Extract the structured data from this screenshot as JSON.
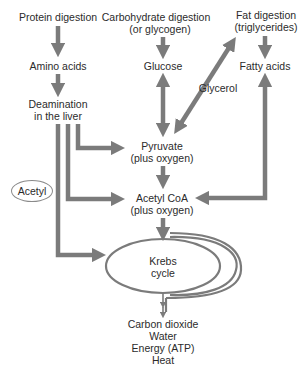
{
  "colors": {
    "arrow": "#7b7b7b",
    "text": "#2b2b2b",
    "background": "#ffffff"
  },
  "nodes": {
    "protein_digestion": "Protein digestion",
    "carb_digestion_1": "Carbohydrate digestion",
    "carb_digestion_2": "(or glycogen)",
    "fat_digestion_1": "Fat digestion",
    "fat_digestion_2": "(triglycerides)",
    "amino_acids": "Amino acids",
    "glucose": "Glucose",
    "fatty_acids": "Fatty acids",
    "glycerol": "Glycerol",
    "deamination_1": "Deamination",
    "deamination_2": "in the liver",
    "pyruvate_1": "Pyruvate",
    "pyruvate_2": "(plus oxygen)",
    "acetyl": "Acetyl",
    "acetyl_coa_1": "Acetyl CoA",
    "acetyl_coa_2": "(plus oxygen)",
    "krebs_1": "Krebs",
    "krebs_2": "cycle",
    "outputs": [
      "Carbon dioxide",
      "Water",
      "Energy (ATP)",
      "Heat"
    ]
  },
  "edges": [
    {
      "from": "Protein digestion",
      "to": "Amino acids"
    },
    {
      "from": "Amino acids",
      "to": "Deamination in the liver"
    },
    {
      "from": "Carbohydrate digestion (or glycogen)",
      "to": "Glucose"
    },
    {
      "from": "Fat digestion (triglycerides)",
      "to": "Fatty acids"
    },
    {
      "from": "Glucose",
      "to": "Pyruvate",
      "bidirectional": true
    },
    {
      "from": "Pyruvate",
      "to": "Fat digestion (triglycerides)",
      "label": "Glycerol",
      "bidirectional": true
    },
    {
      "from": "Deamination in the liver",
      "to": "Pyruvate"
    },
    {
      "from": "Deamination in the liver",
      "to": "Acetyl CoA"
    },
    {
      "from": "Deamination in the liver",
      "to": "Krebs cycle",
      "label": "Acetyl"
    },
    {
      "from": "Pyruvate",
      "to": "Acetyl CoA"
    },
    {
      "from": "Fatty acids",
      "to": "Acetyl CoA",
      "bidirectional": true
    },
    {
      "from": "Acetyl CoA",
      "to": "Krebs cycle"
    },
    {
      "from": "Krebs cycle",
      "to": "Carbon dioxide, Water, Energy (ATP), Heat"
    }
  ]
}
